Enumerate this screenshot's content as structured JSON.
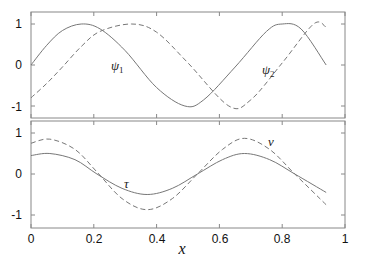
{
  "chart_data": [
    {
      "type": "line",
      "panel": "top",
      "xlim": [
        0,
        1
      ],
      "ylim": [
        -1.3,
        1.3
      ],
      "yticks": [
        -1,
        0,
        1
      ],
      "xticks": [
        0,
        0.2,
        0.4,
        0.6,
        0.8,
        1
      ],
      "grid": false,
      "series": [
        {
          "name": "ψ1",
          "style": "solid",
          "x": [
            0,
            0.05,
            0.1,
            0.16,
            0.22,
            0.3,
            0.4,
            0.49,
            0.55,
            0.65,
            0.75,
            0.8,
            0.86,
            0.94
          ],
          "y": [
            0,
            0.48,
            0.84,
            1.0,
            0.88,
            0.35,
            -0.55,
            -1.0,
            -0.85,
            -0.05,
            0.82,
            1.0,
            0.88,
            0.0
          ]
        },
        {
          "name": "ψ2",
          "style": "dashed",
          "x": [
            0,
            0.05,
            0.1,
            0.16,
            0.22,
            0.32,
            0.4,
            0.5,
            0.63,
            0.7,
            0.8,
            0.9,
            0.94
          ],
          "y": [
            -0.8,
            -0.45,
            -0.05,
            0.45,
            0.82,
            1.0,
            0.8,
            0.05,
            -1.0,
            -0.85,
            0.05,
            1.0,
            0.92
          ]
        }
      ],
      "annotations": [
        {
          "text": "ψ1",
          "x": 0.37,
          "y": -0.1
        },
        {
          "text": "ψ2",
          "x": 0.75,
          "y": -0.15
        }
      ]
    },
    {
      "type": "line",
      "panel": "bottom",
      "xlim": [
        0,
        1
      ],
      "ylim": [
        -1.3,
        1.3
      ],
      "yticks": [
        -1,
        0,
        1
      ],
      "xticks": [
        0,
        0.2,
        0.4,
        0.6,
        0.8,
        1
      ],
      "xlabel": "x",
      "grid": false,
      "series": [
        {
          "name": "τ",
          "style": "solid",
          "x": [
            0,
            0.06,
            0.14,
            0.21,
            0.29,
            0.37,
            0.45,
            0.53,
            0.61,
            0.68,
            0.76,
            0.84,
            0.94
          ],
          "y": [
            0.45,
            0.5,
            0.35,
            0.0,
            -0.35,
            -0.5,
            -0.35,
            0.0,
            0.35,
            0.5,
            0.35,
            0.0,
            -0.45
          ]
        },
        {
          "name": "ν",
          "style": "dashed",
          "x": [
            0,
            0.06,
            0.14,
            0.21,
            0.29,
            0.37,
            0.45,
            0.53,
            0.61,
            0.68,
            0.76,
            0.84,
            0.94
          ],
          "y": [
            0.75,
            0.85,
            0.6,
            0.05,
            -0.6,
            -0.87,
            -0.6,
            -0.0,
            0.6,
            0.87,
            0.6,
            0.0,
            -0.75
          ]
        }
      ],
      "annotations": [
        {
          "text": "τ",
          "x": 0.3,
          "y": -0.25
        },
        {
          "text": "ν",
          "x": 0.8,
          "y": 0.85
        }
      ]
    }
  ],
  "labels": {
    "psi1": "ψ",
    "psi1_sub": "1",
    "psi2": "ψ",
    "psi2_sub": "2",
    "tau": "τ",
    "nu": "ν",
    "xlabel": "x",
    "yticks": [
      "1",
      "0",
      "-1"
    ],
    "xticks": [
      "0",
      "0.2",
      "0.4",
      "0.6",
      "0.8",
      "1"
    ]
  }
}
